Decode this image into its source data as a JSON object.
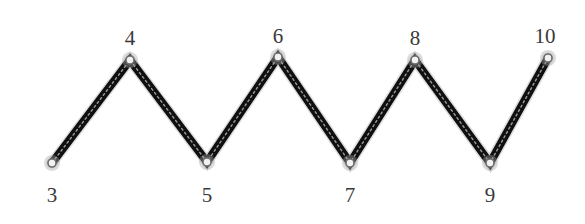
{
  "figure": {
    "type": "zigzag-path-diagram",
    "width": 585,
    "height": 224,
    "background_color": "#ffffff",
    "stroke_color": "#101010",
    "stroke_highlight_color": "#8c8c8c",
    "stroke_width": 8,
    "marker_fill_color": "#f2f2f2",
    "marker_edge_color": "#6e6e6e",
    "marker_radius": 4,
    "label_color": "#3a3a3a",
    "label_font_size": 21
  },
  "chart_data": {
    "type": "line",
    "title": "",
    "xlabel": "",
    "ylabel": "",
    "grid": false,
    "legend": "none",
    "node_labels": [
      "3",
      "4",
      "5",
      "6",
      "7",
      "8",
      "9",
      "10"
    ],
    "node_positions": [
      {
        "label": "3",
        "x": 52,
        "y": 163,
        "kind": "valley",
        "label_side": "below"
      },
      {
        "label": "4",
        "x": 130,
        "y": 60,
        "kind": "peak",
        "label_side": "above"
      },
      {
        "label": "5",
        "x": 207,
        "y": 162,
        "kind": "valley",
        "label_side": "below"
      },
      {
        "label": "6",
        "x": 278,
        "y": 57,
        "kind": "peak",
        "label_side": "above"
      },
      {
        "label": "7",
        "x": 350,
        "y": 163,
        "kind": "valley",
        "label_side": "below"
      },
      {
        "label": "8",
        "x": 415,
        "y": 60,
        "kind": "peak",
        "label_side": "above"
      },
      {
        "label": "9",
        "x": 490,
        "y": 163,
        "kind": "valley",
        "label_side": "below"
      },
      {
        "label": "10",
        "x": 548,
        "y": 58,
        "kind": "peak",
        "label_side": "above"
      }
    ],
    "x": [
      52,
      130,
      207,
      278,
      350,
      415,
      490,
      548
    ],
    "values": [
      163,
      60,
      162,
      57,
      163,
      60,
      163,
      58
    ],
    "label_positions": [
      {
        "label": "3",
        "x": 52,
        "y": 185
      },
      {
        "label": "4",
        "x": 130,
        "y": 28
      },
      {
        "label": "5",
        "x": 207,
        "y": 185
      },
      {
        "label": "6",
        "x": 278,
        "y": 26
      },
      {
        "label": "7",
        "x": 350,
        "y": 185
      },
      {
        "label": "8",
        "x": 415,
        "y": 28
      },
      {
        "label": "9",
        "x": 490,
        "y": 185
      },
      {
        "label": "10",
        "x": 545,
        "y": 26
      }
    ],
    "segments": [
      {
        "from": "3",
        "to": "4"
      },
      {
        "from": "4",
        "to": "5"
      },
      {
        "from": "5",
        "to": "6"
      },
      {
        "from": "6",
        "to": "7"
      },
      {
        "from": "7",
        "to": "8"
      },
      {
        "from": "8",
        "to": "9"
      },
      {
        "from": "9",
        "to": "10"
      }
    ],
    "polyline_points": "52,163 130,60 207,162 278,57 350,163 415,60 490,163 548,58"
  }
}
